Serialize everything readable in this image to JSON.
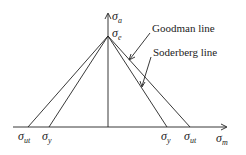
{
  "diagram": {
    "axes": {
      "y_label": {
        "symbol": "σ",
        "sub": "a"
      },
      "x_label": {
        "symbol": "σ",
        "sub": "m"
      }
    },
    "apex_label": {
      "symbol": "σ",
      "sub": "e"
    },
    "x_ticks": [
      {
        "symbol": "σ",
        "sub": "ut",
        "side": "left"
      },
      {
        "symbol": "σ",
        "sub": "y",
        "side": "left"
      },
      {
        "symbol": "σ",
        "sub": "y",
        "side": "right"
      },
      {
        "symbol": "σ",
        "sub": "ut",
        "side": "right"
      }
    ],
    "annotations": {
      "goodman": "Goodman line",
      "soderberg": "Soderberg line"
    },
    "colors": {
      "line": "#222222",
      "background": "#ffffff"
    }
  }
}
